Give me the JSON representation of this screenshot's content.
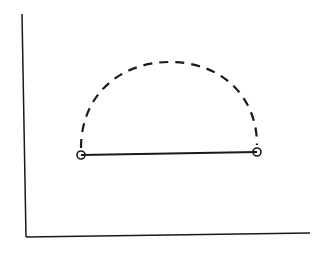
{
  "diagram": {
    "stroke_color": "#1a1a1a",
    "axes": {
      "y_axis": {
        "x1": 22,
        "y1": 14,
        "x2": 26,
        "y2": 237
      },
      "x_axis": {
        "x1": 26,
        "y1": 237,
        "x2": 310,
        "y2": 233
      }
    },
    "segment": {
      "x1": 81,
      "y1": 155,
      "x2": 257,
      "y2": 152
    },
    "arc": {
      "style": "dashed",
      "start": [
        81,
        148
      ],
      "end": [
        257,
        145
      ],
      "top": [
        170,
        62
      ]
    },
    "endpoints": [
      {
        "name": "left-point",
        "cx": 81,
        "cy": 155,
        "r": 4
      },
      {
        "name": "right-point",
        "cx": 257,
        "cy": 152,
        "r": 4
      }
    ]
  }
}
